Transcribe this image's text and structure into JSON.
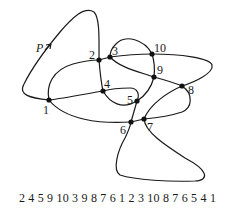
{
  "diagram": {
    "start_label": "P",
    "nodes": [
      {
        "id": "1",
        "label": "1"
      },
      {
        "id": "2",
        "label": "2"
      },
      {
        "id": "3",
        "label": "3"
      },
      {
        "id": "4",
        "label": "4"
      },
      {
        "id": "5",
        "label": "5"
      },
      {
        "id": "6",
        "label": "6"
      },
      {
        "id": "7",
        "label": "7"
      },
      {
        "id": "8",
        "label": "8"
      },
      {
        "id": "9",
        "label": "9"
      },
      {
        "id": "10",
        "label": "10"
      }
    ],
    "path_order": [
      "P",
      "2",
      "4",
      "5",
      "9",
      "10",
      "3",
      "9",
      "8",
      "7",
      "6",
      "1",
      "2",
      "3",
      "10",
      "8",
      "7",
      "6",
      "5",
      "4",
      "1",
      "P"
    ],
    "sequence_text": "2 4 5 9 10 3 9 8 7 6 1 2 3 10 8 7 6 5 4 1",
    "colors": {
      "stroke": "#1a1a1a",
      "background": "#ffffff"
    }
  }
}
